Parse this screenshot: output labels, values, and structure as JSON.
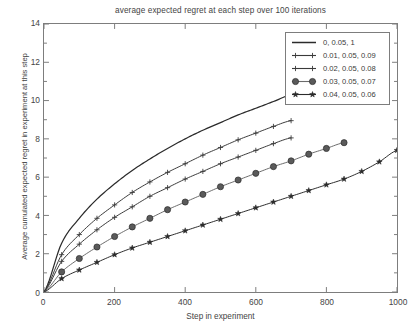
{
  "chart_data": {
    "type": "line",
    "title": "average expected regret at each step over 100 iterations",
    "xlabel": "Step in experiment",
    "ylabel": "Average cumulated expected regret in experiment at this step",
    "xlim": [
      0,
      1000
    ],
    "ylim": [
      0,
      14
    ],
    "xticks": [
      0,
      200,
      400,
      600,
      800,
      1000
    ],
    "yticks": [
      0,
      2,
      4,
      6,
      8,
      10,
      12,
      14
    ],
    "grid": false,
    "legend_position": "top-right",
    "x": [
      0,
      50,
      100,
      150,
      200,
      250,
      300,
      350,
      400,
      450,
      500,
      550,
      600,
      650,
      700,
      750,
      800,
      850,
      900,
      950,
      1000
    ],
    "series": [
      {
        "name": "0, 0.05, 1",
        "marker": "none",
        "color": "#2b2b2b",
        "x_end": 700,
        "values": [
          0,
          2.55,
          3.85,
          4.85,
          5.65,
          6.35,
          6.95,
          7.5,
          8.0,
          8.45,
          8.85,
          9.25,
          9.6,
          9.95,
          10.3,
          10.6,
          10.9,
          null,
          null,
          null,
          null
        ]
      },
      {
        "name": "0.01, 0.05, 0.09",
        "marker": "plus",
        "color": "#3a3a3a",
        "x_end": 700,
        "values": [
          0,
          1.95,
          3.0,
          3.85,
          4.55,
          5.2,
          5.75,
          6.25,
          6.7,
          7.15,
          7.55,
          7.95,
          8.3,
          8.65,
          8.95,
          9.25,
          9.55,
          null,
          null,
          null,
          null
        ]
      },
      {
        "name": "0.02, 0.05, 0.08",
        "marker": "plus",
        "color": "#3a3a3a",
        "x_end": 700,
        "values": [
          0,
          1.6,
          2.5,
          3.25,
          3.9,
          4.45,
          5.0,
          5.45,
          5.9,
          6.3,
          6.7,
          7.05,
          7.4,
          7.75,
          8.05,
          8.35,
          8.65,
          null,
          null,
          null,
          null
        ]
      },
      {
        "name": "0.03, 0.05, 0.07",
        "marker": "circle",
        "color": "#5a5a5a",
        "x_end": 850,
        "values": [
          0,
          1.05,
          1.75,
          2.35,
          2.9,
          3.4,
          3.85,
          4.3,
          4.7,
          5.1,
          5.5,
          5.85,
          6.2,
          6.55,
          6.85,
          7.2,
          7.5,
          7.8,
          8.1,
          8.4,
          null
        ]
      },
      {
        "name": "0.04, 0.05, 0.06",
        "marker": "star",
        "color": "#2b2b2b",
        "x_end": 1000,
        "values": [
          0,
          0.7,
          1.15,
          1.55,
          1.95,
          2.3,
          2.6,
          2.9,
          3.2,
          3.5,
          3.8,
          4.1,
          4.4,
          4.7,
          5.0,
          5.3,
          5.6,
          5.9,
          6.3,
          6.8,
          7.4
        ]
      }
    ]
  },
  "legend": {
    "entries": [
      {
        "label": "0, 0.05, 1"
      },
      {
        "label": "0.01, 0.05, 0.09"
      },
      {
        "label": "0.02, 0.05, 0.08"
      },
      {
        "label": "0.03, 0.05, 0.07"
      },
      {
        "label": "0.04, 0.05, 0.06"
      }
    ]
  },
  "colors": {
    "axis": "#7d7d7d",
    "text": "#444444",
    "line_dark": "#2b2b2b",
    "marker_gray": "#5a5a5a",
    "background": "#ffffff"
  }
}
